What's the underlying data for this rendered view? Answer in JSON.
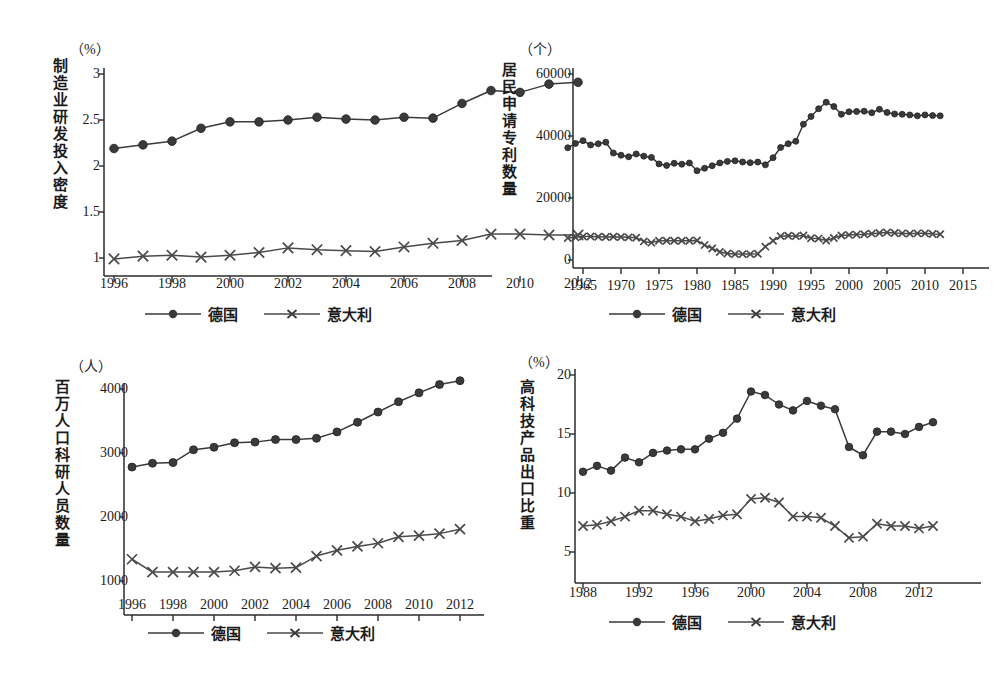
{
  "figure": {
    "series_names": {
      "germany": "德国",
      "italy": "意大利"
    },
    "colors": {
      "germany": "#3a3a3a",
      "italy": "#4a4a4a",
      "axis": "#2b2b2b",
      "background": "#ffffff"
    }
  },
  "charts": [
    {
      "id": "rd-intensity",
      "unit": "（%）",
      "ylabel": "制造业研发投入密度",
      "legend": [
        "德国",
        "意大利"
      ],
      "chart_data": {
        "type": "line",
        "title": "制造业研发投入密度",
        "xlabel": "",
        "ylabel": "制造业研发投入密度",
        "unit": "%",
        "xlim": [
          1996,
          2012
        ],
        "ylim": [
          0.85,
          3.05
        ],
        "yticks": [
          1,
          1.5,
          2,
          2.5,
          3
        ],
        "ytick_labels": [
          "1",
          "1.5",
          "2",
          "2.5",
          "3"
        ],
        "xticks": [
          1996,
          1998,
          2000,
          2002,
          2004,
          2006,
          2008,
          2010,
          2012
        ],
        "xtick_labels": [
          "1996",
          "1998",
          "2000",
          "2002",
          "2004",
          "2006",
          "2008",
          "2010",
          "2012"
        ],
        "grid": false,
        "legend_position": "below",
        "x": [
          1996,
          1997,
          1998,
          1999,
          2000,
          2001,
          2002,
          2003,
          2004,
          2005,
          2006,
          2007,
          2008,
          2009,
          2010,
          2011,
          2012
        ],
        "series": [
          {
            "name": "德国",
            "marker": "circle",
            "values": [
              2.19,
              2.23,
              2.27,
              2.41,
              2.48,
              2.48,
              2.5,
              2.53,
              2.51,
              2.5,
              2.53,
              2.52,
              2.68,
              2.82,
              2.8,
              2.89,
              2.91
            ]
          },
          {
            "name": "意大利",
            "marker": "x",
            "values": [
              0.99,
              1.02,
              1.03,
              1.01,
              1.03,
              1.06,
              1.11,
              1.09,
              1.08,
              1.07,
              1.12,
              1.16,
              1.19,
              1.26,
              1.26,
              1.25,
              1.25
            ]
          }
        ]
      }
    },
    {
      "id": "resident-patent-applications",
      "unit": "（个）",
      "ylabel": "居民申请专利数量",
      "legend": [
        "德国",
        "意大利"
      ],
      "chart_data": {
        "type": "line",
        "title": "居民申请专利数量",
        "xlabel": "",
        "ylabel": "居民申请专利数量",
        "unit": "个",
        "xlim": [
          1963,
          2015
        ],
        "ylim": [
          0,
          60000
        ],
        "yticks": [
          0,
          20000,
          40000,
          60000
        ],
        "ytick_labels": [
          "0",
          "20000",
          "40000",
          "60000"
        ],
        "xticks": [
          1965,
          1970,
          1975,
          1980,
          1985,
          1990,
          1995,
          2000,
          2005,
          2010,
          2015
        ],
        "xtick_labels": [
          "1965",
          "1970",
          "1975",
          "1980",
          "1985",
          "1990",
          "1995",
          "2000",
          "2005",
          "2010",
          "2015"
        ],
        "grid": false,
        "legend_position": "below",
        "x": [
          1963,
          1964,
          1965,
          1966,
          1967,
          1968,
          1969,
          1970,
          1971,
          1972,
          1973,
          1974,
          1975,
          1976,
          1977,
          1978,
          1979,
          1980,
          1981,
          1982,
          1983,
          1984,
          1985,
          1986,
          1987,
          1988,
          1989,
          1990,
          1991,
          1992,
          1993,
          1994,
          1995,
          1996,
          1997,
          1998,
          1999,
          2000,
          2001,
          2002,
          2003,
          2004,
          2005,
          2006,
          2007,
          2008,
          2009,
          2010,
          2011,
          2012
        ],
        "series": [
          {
            "name": "德国",
            "marker": "circle",
            "values": [
              36200,
              37600,
              38500,
              37100,
              37500,
              38000,
              34500,
              33800,
              33300,
              34200,
              33500,
              33100,
              31000,
              30500,
              31200,
              30900,
              31300,
              28800,
              29600,
              30400,
              31300,
              31800,
              32000,
              31600,
              31400,
              31600,
              30700,
              33000,
              36300,
              37500,
              38300,
              43800,
              46300,
              48800,
              50900,
              49500,
              47000,
              47800,
              47900,
              48000,
              47500,
              48600,
              47600,
              47100,
              47000,
              46800,
              46500,
              46800,
              46600,
              46500
            ]
          },
          {
            "name": "意大利",
            "marker": "x",
            "values": [
              7100,
              7300,
              7600,
              7600,
              7500,
              7400,
              7500,
              7400,
              7300,
              7200,
              6000,
              5600,
              6200,
              6200,
              6200,
              6200,
              6200,
              6300,
              4800,
              3700,
              2600,
              2100,
              1900,
              1900,
              1900,
              2000,
              4300,
              6200,
              7700,
              7800,
              7700,
              7900,
              7000,
              6900,
              6300,
              7100,
              7900,
              8100,
              8200,
              8300,
              8500,
              8700,
              8900,
              8700,
              8600,
              8500,
              8600,
              8600,
              8400,
              8300
            ]
          }
        ]
      }
    },
    {
      "id": "researchers-per-million",
      "unit": "（人）",
      "ylabel": "百万人口科研人员数量",
      "legend": [
        "德国",
        "意大利"
      ],
      "chart_data": {
        "type": "line",
        "title": "百万人口科研人员数量",
        "xlabel": "",
        "ylabel": "百万人口科研人员数量",
        "unit": "人",
        "xlim": [
          1996,
          2012
        ],
        "ylim": [
          800,
          4250
        ],
        "yticks": [
          1000,
          2000,
          3000,
          4000
        ],
        "ytick_labels": [
          "1000",
          "2000",
          "3000",
          "4000"
        ],
        "xticks": [
          1996,
          1998,
          2000,
          2002,
          2004,
          2006,
          2008,
          2010,
          2012
        ],
        "xtick_labels": [
          "1996",
          "1998",
          "2000",
          "2002",
          "2004",
          "2006",
          "2008",
          "2010",
          "2012"
        ],
        "grid": false,
        "legend_position": "below",
        "x": [
          1996,
          1997,
          1998,
          1999,
          2000,
          2001,
          2002,
          2003,
          2004,
          2005,
          2006,
          2007,
          2008,
          2009,
          2010,
          2011,
          2012
        ],
        "series": [
          {
            "name": "德国",
            "marker": "circle",
            "values": [
              2780,
              2840,
              2850,
              3050,
              3090,
              3160,
              3170,
              3210,
              3210,
              3230,
              3330,
              3480,
              3640,
              3800,
              3940,
              4070,
              4130
            ]
          },
          {
            "name": "意大利",
            "marker": "x",
            "values": [
              1340,
              1140,
              1140,
              1140,
              1140,
              1160,
              1220,
              1200,
              1210,
              1390,
              1480,
              1540,
              1590,
              1690,
              1710,
              1740,
              1810
            ]
          }
        ]
      }
    },
    {
      "id": "hightech-export-share",
      "unit": "（%）",
      "ylabel": "高科技产品出口比重",
      "legend": [
        "德国",
        "意大利"
      ],
      "chart_data": {
        "type": "line",
        "title": "高科技产品出口比重",
        "xlabel": "",
        "ylabel": "高科技产品出口比重",
        "unit": "%",
        "xlim": [
          1988,
          2013
        ],
        "ylim": [
          4.2,
          20.4
        ],
        "yticks": [
          5,
          10,
          15,
          20
        ],
        "ytick_labels": [
          "5",
          "10",
          "15",
          "20"
        ],
        "xticks": [
          1988,
          1992,
          1996,
          2000,
          2004,
          2008,
          2012
        ],
        "xtick_labels": [
          "1988",
          "1992",
          "1996",
          "2000",
          "2004",
          "2008",
          "2012"
        ],
        "grid": false,
        "legend_position": "below",
        "x": [
          1988,
          1989,
          1990,
          1991,
          1992,
          1993,
          1994,
          1995,
          1996,
          1997,
          1998,
          1999,
          2000,
          2001,
          2002,
          2003,
          2004,
          2005,
          2006,
          2007,
          2008,
          2009,
          2010,
          2011,
          2012,
          2013
        ],
        "series": [
          {
            "name": "德国",
            "marker": "circle",
            "values": [
              11.8,
              12.3,
              11.9,
              13.0,
              12.6,
              13.4,
              13.6,
              13.7,
              13.7,
              14.6,
              15.1,
              16.3,
              18.6,
              18.3,
              17.5,
              17.0,
              17.8,
              17.4,
              17.1,
              13.9,
              13.2,
              15.2,
              15.2,
              15.0,
              15.6,
              16.0
            ]
          },
          {
            "name": "意大利",
            "marker": "x",
            "values": [
              7.2,
              7.3,
              7.6,
              8.0,
              8.5,
              8.5,
              8.2,
              8.0,
              7.6,
              7.8,
              8.1,
              8.2,
              9.5,
              9.6,
              9.2,
              8.0,
              8.0,
              7.9,
              7.2,
              6.2,
              6.3,
              7.4,
              7.2,
              7.2,
              7.0,
              7.2
            ]
          }
        ]
      }
    }
  ]
}
